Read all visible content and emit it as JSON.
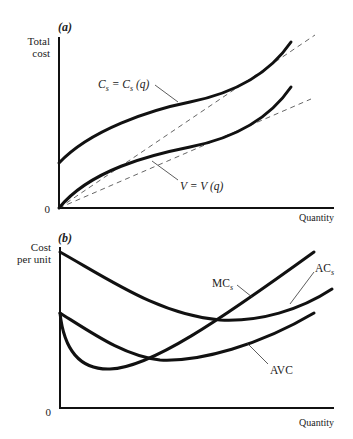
{
  "panels": [
    {
      "id": "a",
      "label": "(a)",
      "y_axis_title": [
        "Total",
        "cost"
      ],
      "x_axis_title": "Quantity",
      "origin_label": "0",
      "curves": [
        {
          "name": "total-cost",
          "label": "C_s = C_s (q)",
          "label_main": "C",
          "label_sub": "s",
          "label_eq": " = C",
          "label_sub2": "s",
          "label_tail": " (q)",
          "style": "solid"
        },
        {
          "name": "variable-cost",
          "label": "V = V (q)",
          "label_text": "V = V (q)",
          "style": "solid"
        },
        {
          "name": "tangent-ray-upper",
          "style": "dashed"
        },
        {
          "name": "tangent-ray-lower",
          "style": "dashed"
        }
      ]
    },
    {
      "id": "b",
      "label": "(b)",
      "y_axis_title": [
        "Cost",
        "per unit"
      ],
      "x_axis_title": "Quantity",
      "origin_label": "0",
      "curves": [
        {
          "name": "marginal-cost",
          "label": "MC_s",
          "label_main": "MC",
          "label_sub": "s",
          "style": "solid"
        },
        {
          "name": "average-cost",
          "label": "AC_s",
          "label_main": "AC",
          "label_sub": "s",
          "style": "solid"
        },
        {
          "name": "average-variable-cost",
          "label": "AVC",
          "label_text": "AVC",
          "style": "solid"
        }
      ]
    }
  ],
  "colors": {
    "curve": "#111111",
    "dashed": "#555555",
    "axis": "#111111",
    "text": "#222222",
    "background": "#ffffff"
  }
}
